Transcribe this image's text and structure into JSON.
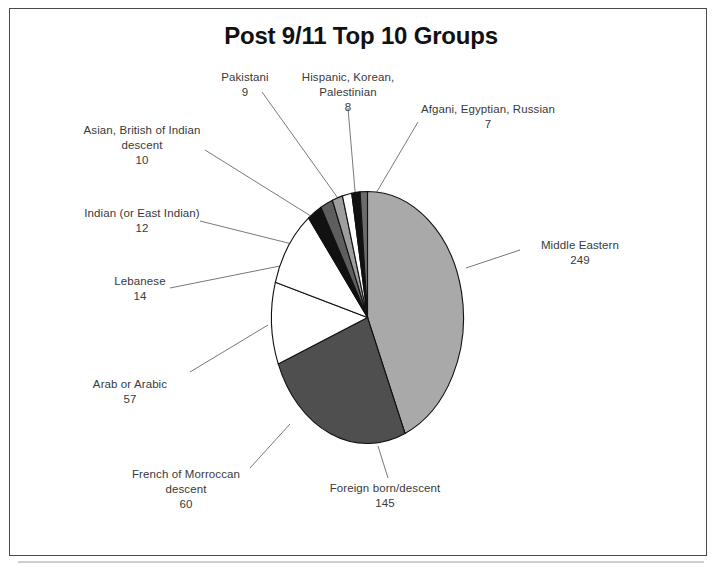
{
  "chart_data": {
    "type": "pie",
    "title": "Post 9/11 Top 10 Groups",
    "xlabel": "",
    "ylabel": "",
    "legend": "none",
    "grid": false,
    "total": 571,
    "categories": [
      "Middle Eastern",
      "Foreign born/descent",
      "French of Morroccan descent",
      "Arab or Arabic",
      "Lebanese",
      "Indian (or East Indian)",
      "Asian, British of Indian descent",
      "Pakistani",
      "Hispanic, Korean, Palestinian",
      "Afgani, Egyptian, Russian"
    ],
    "values": [
      249,
      145,
      60,
      57,
      14,
      12,
      10,
      9,
      8,
      7
    ],
    "slice_colors": [
      "#a9a9a9",
      "#4f4f4f",
      "#ffffff",
      "#ffffff",
      "#111111",
      "#5e5e5e",
      "#9e9e9e",
      "#ffffff",
      "#111111",
      "#6b6b6b"
    ],
    "slices": [
      {
        "label": "Middle Eastern",
        "value": 249,
        "color": "#a9a9a9"
      },
      {
        "label": "Foreign born/descent",
        "value": 145,
        "color": "#4f4f4f"
      },
      {
        "label": "French of Morroccan descent",
        "value": 60,
        "color": "#ffffff"
      },
      {
        "label": "Arab or Arabic",
        "value": 57,
        "color": "#ffffff"
      },
      {
        "label": "Lebanese",
        "value": 14,
        "color": "#111111"
      },
      {
        "label": "Indian (or East Indian)",
        "value": 12,
        "color": "#5e5e5e"
      },
      {
        "label": "Asian, British of Indian descent",
        "value": 10,
        "color": "#9e9e9e"
      },
      {
        "label": "Pakistani",
        "value": 9,
        "color": "#ffffff"
      },
      {
        "label": "Hispanic, Korean, Palestinian",
        "value": 8,
        "color": "#111111"
      },
      {
        "label": "Afgani, Egyptian, Russian",
        "value": 7,
        "color": "#6b6b6b"
      }
    ]
  },
  "labels": {
    "middle_eastern": {
      "name": "Middle Eastern",
      "value": "249"
    },
    "foreign_born": {
      "name": "Foreign born/descent",
      "value": "145"
    },
    "french_morroccan": {
      "name_line1": "French of Morroccan",
      "name_line2": "descent",
      "value": "60"
    },
    "arab_arabic": {
      "name": "Arab or Arabic",
      "value": "57"
    },
    "lebanese": {
      "name": "Lebanese",
      "value": "14"
    },
    "indian": {
      "name": "Indian (or East Indian)",
      "value": "12"
    },
    "asian_british": {
      "name_line1": "Asian, British of Indian",
      "name_line2": "descent",
      "value": "10"
    },
    "pakistani": {
      "name": "Pakistani",
      "value": "9"
    },
    "hispanic_korean": {
      "name_line1": "Hispanic, Korean,",
      "name_line2": "Palestinian",
      "value": "8"
    },
    "afgani_egyptian": {
      "name": "Afgani, Egyptian, Russian",
      "value": "7"
    }
  }
}
